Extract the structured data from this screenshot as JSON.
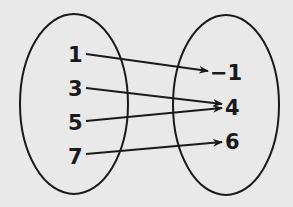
{
  "diagram": {
    "type": "mapping",
    "domain": [
      "1",
      "3",
      "5",
      "7"
    ],
    "range": [
      "−1",
      "4",
      "6"
    ],
    "mappings": [
      {
        "from": "1",
        "to": "−1"
      },
      {
        "from": "3",
        "to": "4"
      },
      {
        "from": "5",
        "to": "4"
      },
      {
        "from": "7",
        "to": "6"
      }
    ],
    "colors": {
      "background": "#e9e9e9",
      "ink": "#1a1a1a"
    }
  }
}
